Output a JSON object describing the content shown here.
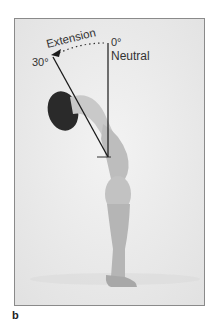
{
  "figure": {
    "panel_label": "b",
    "annotations": {
      "motion": "Extension",
      "start_angle": "0°",
      "start_label": "Neutral",
      "end_angle": "30°"
    },
    "colors": {
      "background": "#ececec",
      "line": "#1a1a1a",
      "frame_border": "#8a8a8a"
    }
  }
}
